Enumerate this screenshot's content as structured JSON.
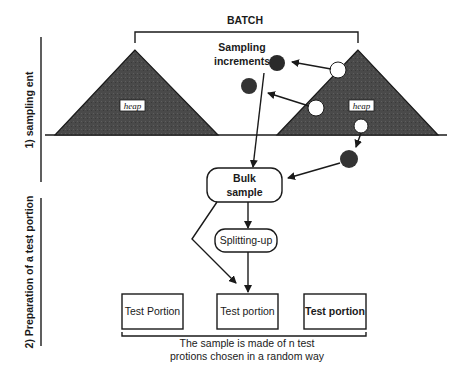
{
  "diagram": {
    "batch_label": "BATCH",
    "sampling_increments_line1": "Sampling",
    "sampling_increments_line2": "increments",
    "heap_left_label": "heap",
    "heap_right_label": "heap",
    "bulk_sample_line1": "Bulk",
    "bulk_sample_line2": "sample",
    "splitting_label": "Splitting-up",
    "test_portions": [
      "Test Portion",
      "Test portion",
      "Test portion"
    ],
    "caption_line1": "The sample is made of n test",
    "caption_line2": "protions chosen in a random way",
    "section1_label": "1) sampling ent",
    "section2_label": "2) Preparation of a test portion",
    "colors": {
      "heap_fill": "#4a4a4a",
      "increment_dark": "#2a2a2a",
      "increment_hole": "#ffffff",
      "line": "#1a1a1a"
    }
  }
}
